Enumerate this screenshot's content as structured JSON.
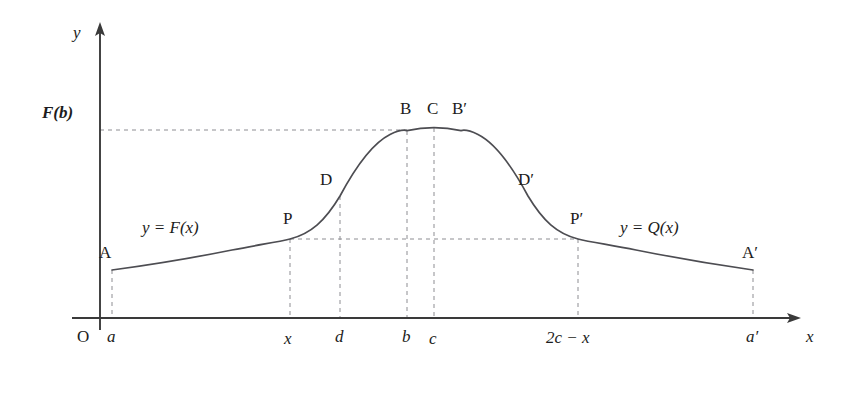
{
  "figure": {
    "axes": {
      "x_axis_label": "x",
      "y_axis_label": "y",
      "origin_label": "O",
      "y_value_label": "F(b)"
    },
    "curve_labels": {
      "left_branch": "y = F(x)",
      "right_branch": "y = Q(x)"
    },
    "points": [
      {
        "name": "A",
        "label": "A",
        "x": 112,
        "y": 270
      },
      {
        "name": "P",
        "label": "P",
        "x": 290,
        "y": 239
      },
      {
        "name": "D",
        "label": "D",
        "x": 340,
        "y": 196
      },
      {
        "name": "B",
        "label": "B",
        "x": 407,
        "y": 131
      },
      {
        "name": "C",
        "label": "C",
        "x": 434,
        "y": 128
      },
      {
        "name": "Bp",
        "label": "B′",
        "x": 461,
        "y": 131
      },
      {
        "name": "Dp",
        "label": "D′",
        "x": 528,
        "y": 196
      },
      {
        "name": "Pp",
        "label": "P′",
        "x": 578,
        "y": 239
      },
      {
        "name": "Ap",
        "label": "A′",
        "x": 753,
        "y": 270
      }
    ],
    "x_ticks": [
      {
        "name": "a",
        "label": "a",
        "x": 112
      },
      {
        "name": "x",
        "label": "x",
        "x": 290
      },
      {
        "name": "d",
        "label": "d",
        "x": 340
      },
      {
        "name": "b",
        "label": "b",
        "x": 407
      },
      {
        "name": "c",
        "label": "c",
        "x": 434
      },
      {
        "name": "2c-x",
        "label": "2c − x",
        "x": 578
      },
      {
        "name": "a-prime",
        "label": "a′",
        "x": 753
      }
    ],
    "geometry": {
      "x_axis_y": 318,
      "y_axis_x": 100,
      "y_axis_top": 25,
      "x_axis_right": 800,
      "peak_y": 128,
      "fb_line_y": 130,
      "p_line_y": 239,
      "curve_path": "M 112,270 C 150,265 190,258 228,250 C 258,244 278,242 290,239 C 312,233 326,222 340,196 C 356,166 374,142 392,133 C 400,129.5 404,128.6 407,131 C 418,128.6 426,127.6 434,128 C 442,127.6 450,128.6 461,131 C 464,128.6 468,129.5 476,133 C 494,142 512,166 528,196 C 542,222 556,233 578,239 C 590,242 610,244 640,250 C 678,258 718,265 753,270"
    },
    "guides": {
      "horizontal": [
        {
          "name": "fb-guide",
          "x1": 100,
          "x2": 407,
          "y": 130
        },
        {
          "name": "p-guide",
          "x1": 290,
          "x2": 578,
          "y": 239
        }
      ],
      "vertical": [
        {
          "name": "a-guide",
          "x": 112,
          "y1": 270,
          "y2": 318
        },
        {
          "name": "x-guide",
          "x": 290,
          "y1": 239,
          "y2": 318
        },
        {
          "name": "d-guide",
          "x": 340,
          "y1": 196,
          "y2": 318
        },
        {
          "name": "b-guide",
          "x": 407,
          "y1": 131,
          "y2": 318
        },
        {
          "name": "c-guide",
          "x": 434,
          "y1": 128,
          "y2": 318
        },
        {
          "name": "2cx-guide",
          "x": 578,
          "y1": 239,
          "y2": 318
        },
        {
          "name": "aprime-guide",
          "x": 753,
          "y1": 270,
          "y2": 318
        }
      ]
    },
    "colors": {
      "axis": "#3a3a3a",
      "curve": "#4d4d52",
      "guide": "#8d8d92",
      "text": "#1c1c20",
      "background": "#ffffff"
    }
  }
}
